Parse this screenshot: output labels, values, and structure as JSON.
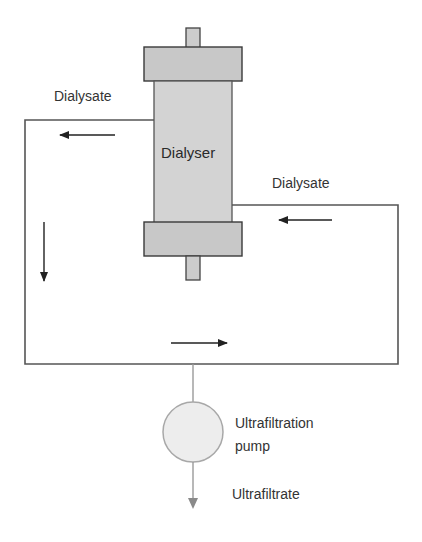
{
  "diagram": {
    "type": "haemodialysis dialysate circuit",
    "components": {
      "dialyser": {
        "label": "Dialyser"
      },
      "pump": {
        "label_line1": "Ultrafiltration",
        "label_line2": "pump"
      }
    },
    "labels": {
      "dialysate_out": "Dialysate",
      "dialysate_in": "Dialysate",
      "ultrafiltrate": "Ultrafiltrate"
    },
    "flow_arrows": [
      {
        "name": "top-left-arrow",
        "direction": "left"
      },
      {
        "name": "left-side-arrow",
        "direction": "down"
      },
      {
        "name": "bottom-arrow",
        "direction": "right"
      },
      {
        "name": "right-top-arrow",
        "direction": "left"
      },
      {
        "name": "ultrafiltrate-arrow",
        "direction": "down"
      }
    ],
    "colors": {
      "line": "#555555",
      "body_fill": "#d3d3d3",
      "cap_fill": "#c8c8c8",
      "pump_fill": "#ededed",
      "pump_stroke": "#a8a8a8",
      "text": "#333333"
    }
  }
}
